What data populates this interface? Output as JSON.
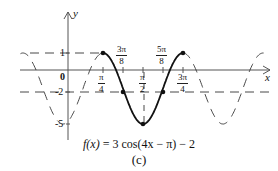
{
  "axes": {
    "x_label": "x",
    "y_label": "y",
    "origin_label": "0",
    "y_ticks": [
      {
        "value": 1,
        "label": "1"
      },
      {
        "value": -2,
        "label": "-2"
      },
      {
        "value": -5,
        "label": "-5"
      }
    ],
    "x_ticks": [
      {
        "value": "π/4",
        "num": "π",
        "den": "4"
      },
      {
        "value": "3π/8",
        "num": "3π",
        "den": "8"
      },
      {
        "value": "π/2",
        "num": "π",
        "den": "2"
      },
      {
        "value": "5π/8",
        "num": "5π",
        "den": "8"
      },
      {
        "value": "3π/4",
        "num": "3π",
        "den": "4"
      }
    ]
  },
  "function": {
    "formula": "f(x) = 3cos(4x − π) − 2",
    "amplitude": 3,
    "period": "π/2",
    "phase_shift": "π/4",
    "vertical_shift": -2,
    "key_points": [
      {
        "x": "π/4",
        "y": 1
      },
      {
        "x": "3π/8",
        "y": -2
      },
      {
        "x": "π/2",
        "y": -5
      },
      {
        "x": "5π/8",
        "y": -2
      },
      {
        "x": "3π/4",
        "y": 1
      }
    ]
  },
  "caption": {
    "formula_lhs": "f(x)",
    "formula_rhs": " = 3 cos(4x − π) − 2",
    "label": "(c)"
  }
}
